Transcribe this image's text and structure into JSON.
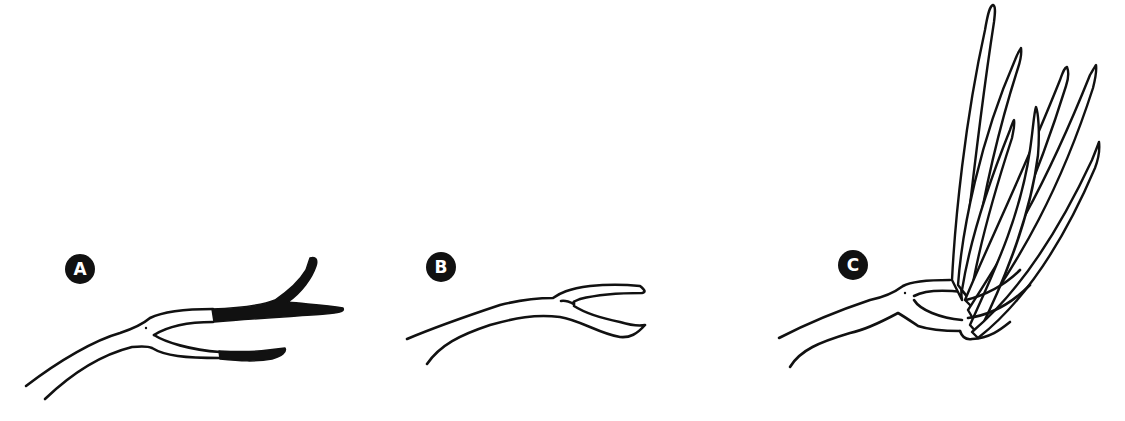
{
  "diagram": {
    "type": "illustration",
    "colors": {
      "ink": "#111111",
      "background": "#ffffff"
    },
    "panels": [
      {
        "id": "a",
        "label": "A",
        "note": "forked branch with shaded tips marked for removal"
      },
      {
        "id": "b",
        "label": "B",
        "note": "branch after tips are cut back"
      },
      {
        "id": "c",
        "label": "C",
        "note": "cluster of long vigorous shoots regrowing from the cut ends"
      }
    ]
  }
}
